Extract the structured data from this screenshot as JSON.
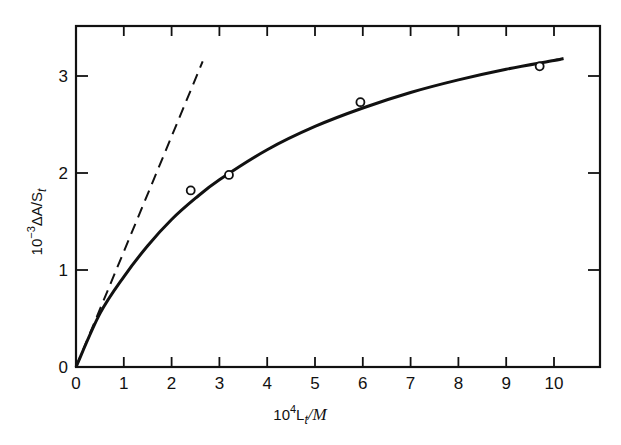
{
  "chart_data": {
    "type": "line",
    "title": "",
    "xlabel": "10^4 L_t/M",
    "ylabel": "10^-3 ΔA/S_t",
    "xlim": [
      0,
      11
    ],
    "ylim": [
      0,
      3.5
    ],
    "x_ticks": [
      "0",
      "1",
      "2",
      "3",
      "4",
      "5",
      "6",
      "7",
      "8",
      "9",
      "10"
    ],
    "y_ticks": [
      "0",
      "1",
      "2",
      "3"
    ],
    "grid": false,
    "legend": null,
    "series": [
      {
        "name": "experimental points",
        "style": "open-circle",
        "x": [
          2.4,
          3.2,
          5.95,
          9.7
        ],
        "y": [
          1.82,
          1.98,
          2.73,
          3.1
        ]
      },
      {
        "name": "fitted curve",
        "style": "solid",
        "x": [
          0,
          0.5,
          1,
          1.5,
          2,
          2.5,
          3,
          4,
          5,
          6,
          7,
          8,
          9,
          10,
          10.2
        ],
        "y": [
          0,
          0.55,
          0.93,
          1.25,
          1.52,
          1.74,
          1.93,
          2.24,
          2.48,
          2.67,
          2.83,
          2.96,
          3.07,
          3.16,
          3.18
        ]
      },
      {
        "name": "initial slope (tangent)",
        "style": "dashed",
        "x": [
          0,
          2.65
        ],
        "y": [
          0,
          3.15
        ]
      }
    ]
  },
  "axes": {
    "x_label_prefix": "10",
    "x_label_sup": "4",
    "x_label_main": "L",
    "x_label_sub": "t",
    "x_label_unit": "/M",
    "y_label_prefix": "10",
    "y_label_sup": "−3",
    "y_label_main": "ΔA/S",
    "y_label_sub": "t"
  }
}
